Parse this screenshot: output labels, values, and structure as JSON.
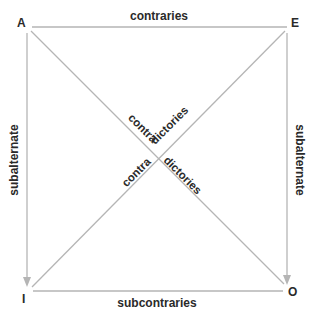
{
  "corners": {
    "A": "A",
    "E": "E",
    "I": "I",
    "O": "O"
  },
  "relations": {
    "top": "contraries",
    "bottom": "subcontraries",
    "left": "subalternate",
    "right": "subalternate",
    "diag_ae_1": "contra",
    "diag_ae_2": "dictories",
    "diag_ei_1": "contra",
    "diag_ei_2": "dictories"
  },
  "colors": {
    "line": "#b5b5b5",
    "text": "#2a2a2a"
  }
}
